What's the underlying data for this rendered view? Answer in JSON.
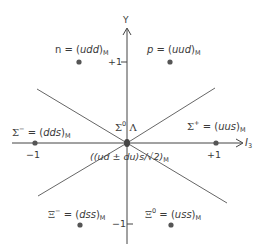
{
  "axes": {
    "x_label": "I",
    "x_label_sub": "3",
    "y_label": "Y",
    "x_ticks": [
      {
        "label": "−1",
        "value": -1
      },
      {
        "label": "+1",
        "value": 1
      }
    ],
    "y_ticks": [
      {
        "label": "+1",
        "value": 1
      },
      {
        "label": "−1",
        "value": -1
      }
    ]
  },
  "particles": [
    {
      "id": "n",
      "symbol": "n",
      "sup": "",
      "eq": " = (",
      "quarks": "udd",
      "close": ")",
      "sub": "M",
      "I3": -0.5,
      "Y": 1
    },
    {
      "id": "p",
      "symbol": "p",
      "sup": "",
      "eq": " = (",
      "quarks": "uud",
      "close": ")",
      "sub": "M",
      "I3": 0.5,
      "Y": 1
    },
    {
      "id": "sigma-minus",
      "symbol": "Σ",
      "sup": "−",
      "eq": " = (",
      "quarks": "dds",
      "close": ")",
      "sub": "M",
      "I3": -1,
      "Y": 0
    },
    {
      "id": "sigma-plus",
      "symbol": "Σ",
      "sup": "+",
      "eq": " = (",
      "quarks": "uus",
      "close": ")",
      "sub": "M",
      "I3": 1,
      "Y": 0
    },
    {
      "id": "xi-minus",
      "symbol": "Ξ",
      "sup": "−",
      "eq": " = (",
      "quarks": "dss",
      "close": ")",
      "sub": "M",
      "I3": -0.5,
      "Y": -1
    },
    {
      "id": "xi-zero",
      "symbol": "Ξ",
      "sup": "0",
      "eq": " = (",
      "quarks": "uss",
      "close": ")",
      "sub": "M",
      "I3": 0.5,
      "Y": -1
    }
  ],
  "center": {
    "label_top_sigma": "Σ",
    "label_top_sup": "0",
    "label_top_lambda": " Λ",
    "label_bottom": "((ud ± du)s/√2)",
    "label_bottom_sub": "M",
    "I3": 0,
    "Y": 0
  },
  "colors": {
    "line": "#4a4a4a",
    "dot": "#555555",
    "text": "#3a3a3a"
  }
}
